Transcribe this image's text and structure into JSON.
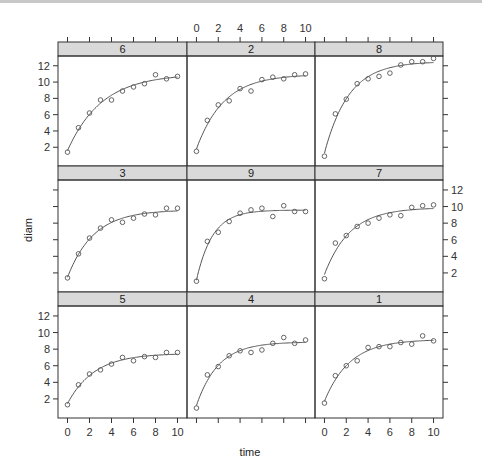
{
  "chart_data": {
    "type": "scatter",
    "subtype": "trellis-scatter-with-fitted-curve",
    "xlabel": "time",
    "ylabel": "diam",
    "xlim": [
      -0.5,
      10.5
    ],
    "ylim": [
      -0.3,
      13.2
    ],
    "x_ticks": [
      0,
      2,
      4,
      6,
      8,
      10
    ],
    "y_ticks": [
      2,
      4,
      6,
      8,
      10,
      12
    ],
    "layout": {
      "columns": 3,
      "rows": 3
    },
    "x": [
      0,
      1,
      2,
      3,
      4,
      5,
      6,
      7,
      8,
      9,
      10
    ],
    "panels": [
      {
        "label": "6",
        "row": 0,
        "col": 0,
        "values": [
          1.4,
          4.4,
          6.2,
          7.8,
          7.8,
          8.9,
          9.4,
          9.8,
          10.9,
          10.4,
          10.7
        ]
      },
      {
        "label": "2",
        "row": 0,
        "col": 1,
        "values": [
          1.5,
          5.3,
          7.2,
          7.7,
          9.2,
          8.9,
          10.3,
          10.6,
          10.4,
          10.9,
          11.0
        ]
      },
      {
        "label": "8",
        "row": 0,
        "col": 2,
        "values": [
          0.9,
          6.1,
          7.9,
          9.8,
          10.4,
          10.7,
          11.1,
          12.1,
          12.5,
          12.5,
          12.9
        ]
      },
      {
        "label": "3",
        "row": 1,
        "col": 0,
        "values": [
          1.4,
          4.3,
          6.2,
          7.4,
          8.4,
          8.1,
          8.6,
          9.1,
          9.0,
          9.8,
          9.8
        ]
      },
      {
        "label": "9",
        "row": 1,
        "col": 1,
        "values": [
          1.0,
          5.8,
          6.9,
          8.2,
          9.2,
          9.6,
          9.8,
          8.8,
          10.1,
          9.4,
          9.4
        ]
      },
      {
        "label": "7",
        "row": 1,
        "col": 2,
        "values": [
          1.3,
          5.6,
          6.5,
          7.6,
          8.0,
          8.6,
          9.0,
          8.9,
          9.9,
          10.1,
          10.2
        ]
      },
      {
        "label": "5",
        "row": 2,
        "col": 0,
        "values": [
          1.3,
          3.7,
          5.0,
          5.5,
          6.2,
          7.0,
          6.6,
          7.1,
          7.0,
          7.6,
          7.6
        ]
      },
      {
        "label": "4",
        "row": 2,
        "col": 1,
        "values": [
          0.9,
          4.9,
          5.9,
          7.2,
          7.8,
          7.6,
          7.9,
          8.7,
          9.4,
          8.7,
          9.1
        ]
      },
      {
        "label": "1",
        "row": 2,
        "col": 2,
        "values": [
          1.5,
          4.8,
          6.0,
          6.6,
          8.2,
          8.3,
          8.3,
          8.8,
          8.6,
          9.6,
          9.0
        ]
      }
    ],
    "axis_placement": {
      "x_bottom_labels_columns": [
        0,
        2
      ],
      "x_top_labels_columns": [
        1
      ],
      "y_left_labels_rows": [
        0,
        2
      ],
      "y_right_labels_rows": [
        1
      ]
    },
    "colors": {
      "strip_fill": "#d9d9d9",
      "frame": "#333333",
      "points": "#555555",
      "curve": "#555555"
    },
    "grid": false,
    "legend": "none"
  }
}
